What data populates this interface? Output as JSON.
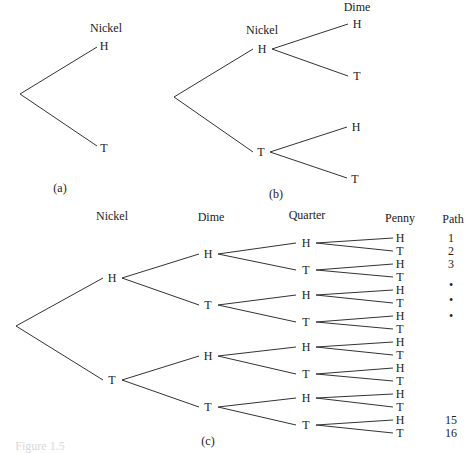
{
  "diagrams": {
    "a": {
      "caption": "(a)",
      "headers": [
        "Nickel"
      ],
      "nodes": [
        "H",
        "T"
      ]
    },
    "b": {
      "caption": "(b)",
      "headers": [
        "Nickel",
        "Dime"
      ],
      "level1": [
        "H",
        "T"
      ],
      "level2": [
        "H",
        "T",
        "H",
        "T"
      ]
    },
    "c": {
      "caption": "(c)",
      "headers": [
        "Nickel",
        "Dime",
        "Quarter",
        "Penny",
        "Path"
      ],
      "nickel": [
        "H",
        "T"
      ],
      "dime": [
        "H",
        "T",
        "H",
        "T"
      ],
      "quarter": [
        "H",
        "T",
        "H",
        "T",
        "H",
        "T",
        "H",
        "T"
      ],
      "penny": [
        "H",
        "T",
        "H",
        "T",
        "H",
        "T",
        "H",
        "T",
        "H",
        "T",
        "H",
        "T",
        "H",
        "T",
        "H",
        "T"
      ],
      "path_labels": [
        "1",
        "2",
        "3",
        "•",
        "•",
        "•",
        "15",
        "16"
      ]
    }
  },
  "figure_caption": "Figure 1.5"
}
